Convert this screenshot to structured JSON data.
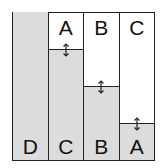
{
  "diagram": {
    "columns": [
      {
        "top_label": "",
        "bottom_label": "D",
        "shade_height_px": 148,
        "divider_top_px": null
      },
      {
        "top_label": "A",
        "bottom_label": "C",
        "shade_height_px": 112,
        "divider_top_px": 36
      },
      {
        "top_label": "B",
        "bottom_label": "B",
        "shade_height_px": 75,
        "divider_top_px": 73
      },
      {
        "top_label": "C",
        "bottom_label": "A",
        "shade_height_px": 38,
        "divider_top_px": 110
      }
    ],
    "arrow_icon": "double-vertical-arrow",
    "colors": {
      "shade": "#dcdcdc",
      "line": "#222222",
      "background": "#ffffff"
    }
  }
}
